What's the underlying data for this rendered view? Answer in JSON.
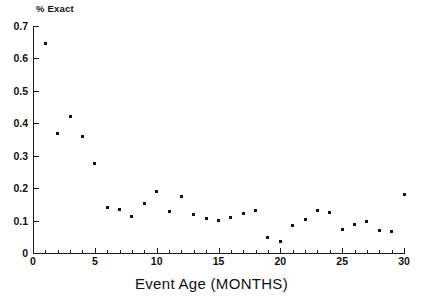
{
  "chart_data": {
    "type": "scatter",
    "title": "",
    "xlabel": "Event Age (MONTHS)",
    "ylabel": "% Exact",
    "xlim": [
      0,
      30
    ],
    "ylim": [
      0,
      0.7
    ],
    "grid": false,
    "legend": null,
    "x_tick_labels": [
      "0",
      "5",
      "10",
      "15",
      "20",
      "25",
      "30"
    ],
    "x_tick_values": [
      0,
      5,
      10,
      15,
      20,
      25,
      30
    ],
    "x_minor_tick_step": 1,
    "y_tick_labels": [
      "0",
      "0.1",
      "0.2",
      "0.3",
      "0.4",
      "0.5",
      "0.6",
      "0.7"
    ],
    "y_tick_values": [
      0,
      0.1,
      0.2,
      0.3,
      0.4,
      0.5,
      0.6,
      0.7
    ],
    "marker": "square",
    "marker_color": "#141414",
    "x": [
      1,
      2,
      3,
      4,
      5,
      6,
      7,
      8,
      9,
      10,
      11,
      12,
      13,
      14,
      15,
      16,
      17,
      18,
      19,
      20,
      21,
      22,
      23,
      24,
      25,
      26,
      27,
      28,
      29,
      30
    ],
    "values": [
      0.645,
      0.37,
      0.42,
      0.358,
      0.277,
      0.139,
      0.134,
      0.112,
      0.152,
      0.191,
      0.129,
      0.175,
      0.12,
      0.105,
      0.101,
      0.11,
      0.121,
      0.13,
      0.048,
      0.035,
      0.086,
      0.104,
      0.131,
      0.124,
      0.072,
      0.088,
      0.097,
      0.068,
      0.066,
      0.18
    ]
  },
  "axes": {
    "x_title": "Event Age (MONTHS)",
    "y_title": "% Exact"
  }
}
